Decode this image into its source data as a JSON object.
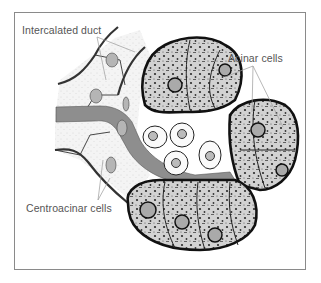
{
  "figure": {
    "labels": {
      "intercalated_duct": "Intercalated duct",
      "acinar_cells": "Acinar cells",
      "centroacinar_cells": "Centroacinar cells"
    },
    "colors": {
      "frame": "#8a8a8a",
      "label_text": "#555555",
      "leader_line": "#9a9a9a",
      "lumen": "#8e8e8e",
      "duct_cell": "#f2f2f2",
      "acinar_cell": "#cfcfcf",
      "outline": "#222222",
      "nucleus": "#b5b5b5"
    }
  }
}
